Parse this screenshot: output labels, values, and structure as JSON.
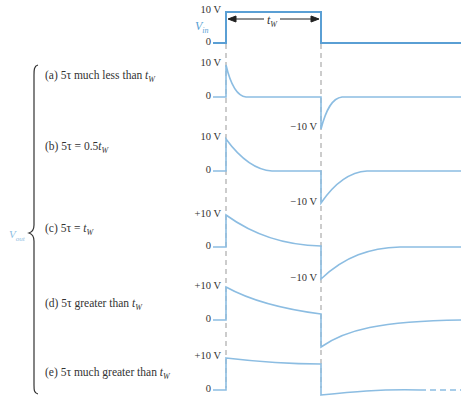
{
  "input": {
    "label_main": "V",
    "label_sub": "in",
    "high_label": "10 V",
    "zero_label": "0",
    "pulse_width_main": "t",
    "pulse_width_sub": "W",
    "color": "#5a9fd4"
  },
  "output": {
    "label_main": "V",
    "label_sub": "out",
    "color": "#8cbde2"
  },
  "cases": [
    {
      "prefix": "(a) 5τ much less than ",
      "tw_main": "t",
      "tw_sub": "W",
      "pos_label": "10 V",
      "zero_label": "0",
      "neg_label": "−10 V"
    },
    {
      "prefix": "(b) 5τ  =  0.5",
      "tw_main": "t",
      "tw_sub": "W",
      "pos_label": "10 V",
      "zero_label": "0",
      "neg_label": "−10 V"
    },
    {
      "prefix": "(c) 5τ  =  ",
      "tw_main": "t",
      "tw_sub": "W",
      "pos_label": "+10 V",
      "zero_label": "0",
      "neg_label": "−10 V"
    },
    {
      "prefix": "(d) 5τ greater than ",
      "tw_main": "t",
      "tw_sub": "W",
      "pos_label": "+10 V",
      "zero_label": "0",
      "neg_label": ""
    },
    {
      "prefix": "(e) 5τ much greater than ",
      "tw_main": "t",
      "tw_sub": "W",
      "pos_label": "+10 V",
      "zero_label": "0",
      "neg_label": ""
    }
  ]
}
